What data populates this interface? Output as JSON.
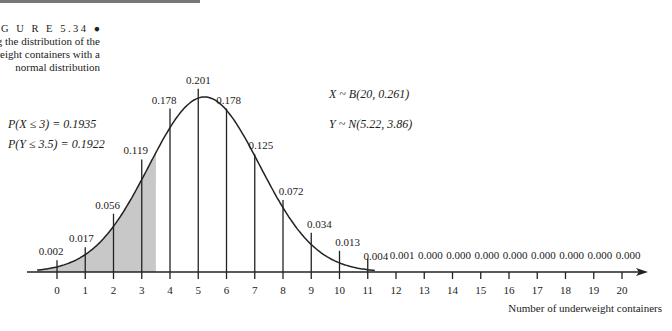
{
  "figure": {
    "label": "F I G U R E 5.34",
    "caption_lines": [
      "Approximating the distribution of the",
      "number of underweight containers with a",
      "normal distribution"
    ]
  },
  "annotations": {
    "px": "P(X ≤ 3) = 0.1935",
    "py": "P(Y ≤ 3.5) = 0.1922",
    "xdist": "X ~ B(20, 0.261)",
    "ydist": "Y ~ N(5.22, 3.86)"
  },
  "chart_data": {
    "type": "bar",
    "title": "Approximating the distribution of the number of underweight containers with a normal distribution",
    "xlabel": "Number of underweight containers",
    "ylabel": "",
    "categories": [
      "0",
      "1",
      "2",
      "3",
      "4",
      "5",
      "6",
      "7",
      "8",
      "9",
      "10",
      "11",
      "12",
      "13",
      "14",
      "15",
      "16",
      "17",
      "18",
      "19",
      "20"
    ],
    "values": [
      0.002,
      0.017,
      0.056,
      0.119,
      0.178,
      0.201,
      0.178,
      0.125,
      0.072,
      0.034,
      0.013,
      0.004,
      0.001,
      0.0,
      0.0,
      0.0,
      0.0,
      0.0,
      0.0,
      0.0,
      0.0
    ],
    "value_labels": [
      "0.002",
      "0.017",
      "0.056",
      "0.119",
      "0.178",
      "0.201",
      "0.178",
      "0.125",
      "0.072",
      "0.034",
      "0.013",
      "0.004",
      "0.001",
      "0.000",
      "0.000",
      "0.000",
      "0.000",
      "0.000",
      "0.000",
      "0.000",
      "0.000"
    ],
    "overlay_curve": {
      "distribution": "normal",
      "mean": 5.22,
      "variance": 3.86
    },
    "shaded_region": {
      "from": -0.7,
      "to": 3.5
    },
    "binomial": {
      "n": 20,
      "p": 0.261
    },
    "grid": false,
    "legend": "none"
  }
}
